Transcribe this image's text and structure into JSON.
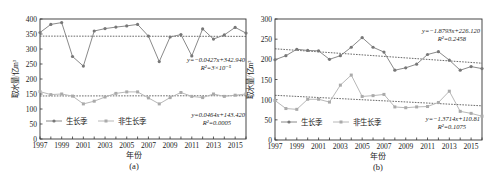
{
  "chart_data": [
    {
      "type": "line",
      "panel_label": "(a)",
      "xlabel": "年份",
      "ylabel": "取水量/亿m³",
      "ylim": [
        0,
        400
      ],
      "yticks": [
        0,
        50,
        100,
        150,
        200,
        250,
        300,
        350,
        400
      ],
      "xlim": [
        1997,
        2016
      ],
      "xticks": [
        1997,
        1999,
        2001,
        2003,
        2005,
        2007,
        2009,
        2011,
        2013,
        2015
      ],
      "grid": false,
      "legend_position": "lower-left",
      "x": [
        1997,
        1998,
        1999,
        2000,
        2001,
        2002,
        2003,
        2004,
        2005,
        2006,
        2007,
        2008,
        2009,
        2010,
        2011,
        2012,
        2013,
        2014,
        2015,
        2016
      ],
      "series": [
        {
          "name": "生长季",
          "marker": "star",
          "values": [
            355,
            382,
            388,
            275,
            243,
            360,
            368,
            373,
            377,
            382,
            343,
            258,
            340,
            348,
            277,
            367,
            333,
            347,
            372,
            353
          ],
          "trend": {
            "equation": "y=−0.0427x+342.940",
            "r2": "R²=3×10⁻⁵",
            "slope": -0.0427,
            "intercept": 342.94
          }
        },
        {
          "name": "非生长季",
          "marker": "square",
          "values": [
            158,
            148,
            150,
            143,
            117,
            126,
            140,
            152,
            157,
            157,
            137,
            117,
            138,
            155,
            142,
            138,
            150,
            142,
            146,
            150
          ],
          "trend": {
            "equation": "y=0.0464x+143.420",
            "r2": "R²=0.0005",
            "slope": 0.0464,
            "intercept": 143.42
          }
        }
      ]
    },
    {
      "type": "line",
      "panel_label": "(b)",
      "xlabel": "年份",
      "ylabel": "取水量/亿m³",
      "ylim": [
        0,
        300
      ],
      "yticks": [
        0,
        50,
        100,
        150,
        200,
        250,
        300
      ],
      "xlim": [
        1997,
        2016
      ],
      "xticks": [
        1997,
        1999,
        2001,
        2003,
        2005,
        2007,
        2009,
        2011,
        2013,
        2015
      ],
      "grid": false,
      "legend_position": "lower-left",
      "x": [
        1997,
        1998,
        1999,
        2000,
        2001,
        2002,
        2003,
        2004,
        2005,
        2006,
        2007,
        2008,
        2009,
        2010,
        2011,
        2012,
        2013,
        2014,
        2015,
        2016
      ],
      "series": [
        {
          "name": "生长季",
          "marker": "star",
          "values": [
            199,
            209,
            225,
            222,
            221,
            200,
            209,
            230,
            254,
            230,
            218,
            173,
            179,
            188,
            212,
            219,
            198,
            173,
            182,
            177
          ],
          "trend": {
            "equation": "y=−1.8793x+226.120",
            "r2": "R²=0.2458",
            "slope": -1.8793,
            "intercept": 226.12
          }
        },
        {
          "name": "非生长季",
          "marker": "square",
          "values": [
            98,
            78,
            76,
            101,
            101,
            94,
            136,
            161,
            108,
            110,
            113,
            82,
            80,
            82,
            83,
            93,
            121,
            71,
            66,
            59
          ],
          "trend": {
            "equation": "y=−1.3714x+110.81",
            "r2": "R²=0.1075",
            "slope": -1.3714,
            "intercept": 110.81
          }
        }
      ]
    }
  ],
  "panels": [
    {
      "label": "(a)",
      "xlabel": "年份",
      "ylabel": "取水量/亿m³",
      "legend": [
        "生长季",
        "非生长季"
      ],
      "eq1": "y=−0.0427x+342.940",
      "r2_1": "R²=3×10⁻⁵",
      "eq2": "y=0.0464x+143.420",
      "r2_2": "R²=0.0005"
    },
    {
      "label": "(b)",
      "xlabel": "年份",
      "ylabel": "取水量/亿m³",
      "legend": [
        "生长季",
        "非生长季"
      ],
      "eq1": "y=−1.8793x+226.120",
      "r2_1": "R²=0.2458",
      "eq2": "y=−1.3714x+110.81",
      "r2_2": "R²=0.1075"
    }
  ],
  "colors": {
    "growing": "#8a8a8a",
    "nongrowing": "#b8b8b8",
    "trend": "#444444",
    "axis": "#333333"
  }
}
